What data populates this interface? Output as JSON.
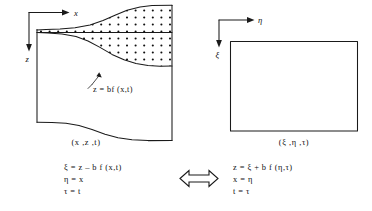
{
  "figure": {
    "type": "coordinate-transformation-diagram",
    "left_panel": {
      "axes": {
        "horizontal_label": "x",
        "vertical_label": "z",
        "origin_corner": "top-left"
      },
      "boundary_label": "z = bf (x,t)",
      "domain_label": "(x ,z ,t)",
      "region_fill": "dotted"
    },
    "right_panel": {
      "axes": {
        "horizontal_label": "η",
        "vertical_label": "ξ",
        "origin_corner": "top-left"
      },
      "domain_label": "(ξ ,η ,τ)",
      "shape": "rectangle"
    },
    "mapping_arrow": "⟺",
    "equations_left": [
      "ξ = z – b f  (x,t)",
      "η = x",
      "τ = t"
    ],
    "equations_right": [
      "z = ξ + b f  (η,τ)",
      "x = η",
      "t = τ"
    ],
    "colors": {
      "ink": "#1a1a1a",
      "background": "#ffffff"
    }
  }
}
